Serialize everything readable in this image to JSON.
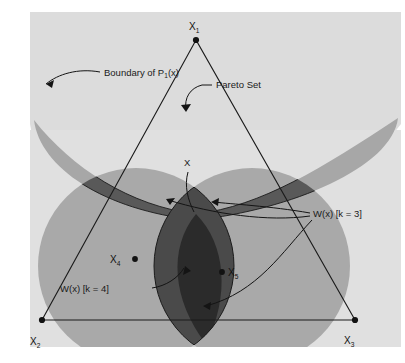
{
  "figure": {
    "panel_bg": "#e9e9e9",
    "page_bg": "#ffffff",
    "ink": "#141414"
  },
  "colors": {
    "band_light": "#e2e2e2",
    "dome_light": "#dedede",
    "disc_mid": "#a9a9a9",
    "overlap_dark": "#5c5c5c",
    "overlap_darkest": "#2b2b2b",
    "outline": "#1b1b1b",
    "text": "#141414"
  },
  "annotations": [
    {
      "id": "boundary",
      "text": "Boundary of P",
      "sub": "1",
      "tail": "(x)",
      "x": 72,
      "y": 76
    },
    {
      "id": "pareto",
      "text": "Pareto Set",
      "x": 216,
      "y": 88
    },
    {
      "id": "x_point",
      "text": "X",
      "x": 186,
      "y": 166
    },
    {
      "id": "wx_k3",
      "text": "W(x) [k = 3]",
      "x": 313,
      "y": 215
    },
    {
      "id": "wx_k4",
      "text": "W(x) [k = 4]",
      "x": 91,
      "y": 290
    }
  ],
  "vertices": [
    {
      "id": "x1",
      "label": "X",
      "sub": "1",
      "px": 196,
      "py": 40,
      "lx": 189,
      "ly": 31
    },
    {
      "id": "x2",
      "label": "X",
      "sub": "2",
      "px": 42,
      "py": 320,
      "lx": 30,
      "ly": 345
    },
    {
      "id": "x3",
      "label": "X",
      "sub": "3",
      "px": 355,
      "py": 320,
      "lx": 345,
      "ly": 344
    }
  ],
  "interior_points": [
    {
      "id": "x4",
      "label": "X",
      "sub": "4",
      "px": 135,
      "py": 259,
      "lx": 110,
      "ly": 264,
      "dot_side": "right"
    },
    {
      "id": "x5",
      "label": "X",
      "sub": "5",
      "px": 222,
      "py": 272,
      "lx": 228,
      "ly": 277,
      "dot_side": "left"
    }
  ],
  "geometry": {
    "panel": {
      "x": 30,
      "y": 12,
      "w": 371,
      "h": 335
    },
    "center": {
      "x": 196,
      "y": 214
    },
    "discs": [
      {
        "id": "disc-top",
        "cx": 196,
        "cy": 28,
        "r": 186
      },
      {
        "id": "disc-left",
        "cx": 136,
        "cy": 266,
        "r": 98
      },
      {
        "id": "disc-right",
        "cx": 252,
        "cy": 266,
        "r": 98
      }
    ]
  }
}
